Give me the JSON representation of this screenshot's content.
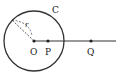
{
  "diagram": {
    "circle": {
      "label": "C",
      "cx": 34,
      "cy": 41,
      "r": 30
    },
    "radius_label": "r",
    "points": [
      {
        "name": "O",
        "x": 34,
        "y": 41
      },
      {
        "name": "P",
        "x": 48,
        "y": 41
      },
      {
        "name": "Q",
        "x": 91,
        "y": 41
      }
    ],
    "colors": {
      "stroke": "#333333",
      "background": "#ffffff"
    }
  }
}
